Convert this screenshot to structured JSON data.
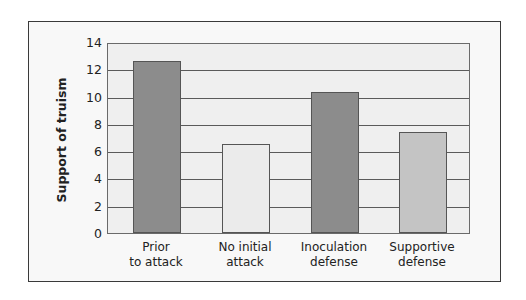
{
  "chart_data": {
    "type": "bar",
    "title": "",
    "xlabel": "",
    "ylabel": "Support of truism",
    "ylim": [
      0,
      14
    ],
    "yticks": [
      0,
      2,
      4,
      6,
      8,
      10,
      12,
      14
    ],
    "grid": true,
    "legend": null,
    "categories": [
      "Prior to attack",
      "No initial attack",
      "Inoculation defense",
      "Supportive defense"
    ],
    "category_lines": [
      [
        "Prior",
        "to attack"
      ],
      [
        "No initial",
        "attack"
      ],
      [
        "Inoculation",
        "defense"
      ],
      [
        "Supportive",
        "defense"
      ]
    ],
    "values": [
      12.6,
      6.5,
      10.3,
      7.4
    ],
    "bar_colors": [
      "#8c8c8c",
      "#ebebeb",
      "#8c8c8c",
      "#c4c4c4"
    ]
  },
  "axis": {
    "ylabel": "Support of truism",
    "ticks": [
      "0",
      "2",
      "4",
      "6",
      "8",
      "10",
      "12",
      "14"
    ]
  },
  "colors": {
    "plot_bg": "#efefef",
    "frame_bg": "#f8f8f8",
    "grid": "#5a5a5a"
  }
}
